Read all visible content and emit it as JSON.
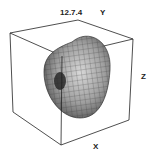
{
  "figure": {
    "title": "12.7.4",
    "axes": {
      "x": "X",
      "y": "Y",
      "z": "Z"
    },
    "surface": "egg-shaped closed surface with mesh grid inside a bounding box",
    "colors": {
      "surface": "#9a9a9a",
      "mesh": "#333333",
      "box": "#222222"
    }
  }
}
